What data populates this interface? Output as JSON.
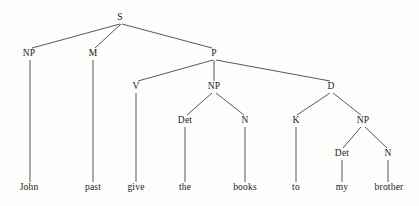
{
  "figure": {
    "kind": "syntax-tree",
    "sentence": "John past give the books to my brother",
    "width": 419,
    "height": 206,
    "background_color": "#fdfdfc",
    "line_color": "#3a3a38",
    "text_color": "#1b1b1b"
  },
  "nodes": [
    {
      "id": "s",
      "label": "S",
      "x": 120,
      "y": 18
    },
    {
      "id": "np1",
      "label": "NP",
      "x": 29,
      "y": 54
    },
    {
      "id": "m",
      "label": "M",
      "x": 93,
      "y": 54
    },
    {
      "id": "p",
      "label": "P",
      "x": 214,
      "y": 54
    },
    {
      "id": "v",
      "label": "V",
      "x": 136,
      "y": 87
    },
    {
      "id": "np2",
      "label": "NP",
      "x": 214,
      "y": 87
    },
    {
      "id": "d",
      "label": "D",
      "x": 331,
      "y": 87
    },
    {
      "id": "det1",
      "label": "Det",
      "x": 185,
      "y": 121
    },
    {
      "id": "n1",
      "label": "N",
      "x": 245,
      "y": 121
    },
    {
      "id": "k",
      "label": "K",
      "x": 296,
      "y": 121
    },
    {
      "id": "np3",
      "label": "NP",
      "x": 363,
      "y": 121
    },
    {
      "id": "det2",
      "label": "Det",
      "x": 342,
      "y": 154
    },
    {
      "id": "n2",
      "label": "N",
      "x": 388,
      "y": 154
    }
  ],
  "leaves": [
    {
      "id": "leaf-john",
      "label": "John",
      "x": 29,
      "y": 188
    },
    {
      "id": "leaf-past",
      "label": "past",
      "x": 93,
      "y": 188
    },
    {
      "id": "leaf-give",
      "label": "give",
      "x": 136,
      "y": 188
    },
    {
      "id": "leaf-the",
      "label": "the",
      "x": 185,
      "y": 188
    },
    {
      "id": "leaf-books",
      "label": "books",
      "x": 245,
      "y": 188
    },
    {
      "id": "leaf-to",
      "label": "to",
      "x": 296,
      "y": 188
    },
    {
      "id": "leaf-my",
      "label": "my",
      "x": 342,
      "y": 188
    },
    {
      "id": "leaf-brother",
      "label": "brother",
      "x": 389,
      "y": 188
    }
  ],
  "edges": [
    {
      "id": "e-s-np1",
      "x1": 120,
      "y1": 24,
      "x2": 32,
      "y2": 48
    },
    {
      "id": "e-s-m",
      "x1": 121,
      "y1": 24,
      "x2": 95,
      "y2": 48
    },
    {
      "id": "e-s-p",
      "x1": 122,
      "y1": 24,
      "x2": 212,
      "y2": 48
    },
    {
      "id": "e-np1-john",
      "x1": 30,
      "y1": 60,
      "x2": 30,
      "y2": 182
    },
    {
      "id": "e-m-past",
      "x1": 93,
      "y1": 60,
      "x2": 93,
      "y2": 182
    },
    {
      "id": "e-p-v",
      "x1": 213,
      "y1": 60,
      "x2": 138,
      "y2": 81
    },
    {
      "id": "e-p-np2",
      "x1": 214,
      "y1": 60,
      "x2": 214,
      "y2": 81
    },
    {
      "id": "e-p-d",
      "x1": 216,
      "y1": 60,
      "x2": 330,
      "y2": 81
    },
    {
      "id": "e-v-give",
      "x1": 136,
      "y1": 93,
      "x2": 136,
      "y2": 182
    },
    {
      "id": "e-np2-det1",
      "x1": 212,
      "y1": 93,
      "x2": 187,
      "y2": 115
    },
    {
      "id": "e-np2-n1",
      "x1": 216,
      "y1": 93,
      "x2": 244,
      "y2": 115
    },
    {
      "id": "e-d-k",
      "x1": 330,
      "y1": 93,
      "x2": 297,
      "y2": 115
    },
    {
      "id": "e-d-np3",
      "x1": 333,
      "y1": 93,
      "x2": 361,
      "y2": 115
    },
    {
      "id": "e-det1-the",
      "x1": 185,
      "y1": 127,
      "x2": 185,
      "y2": 182
    },
    {
      "id": "e-n1-books",
      "x1": 245,
      "y1": 127,
      "x2": 245,
      "y2": 182
    },
    {
      "id": "e-k-to",
      "x1": 296,
      "y1": 127,
      "x2": 296,
      "y2": 182
    },
    {
      "id": "e-np3-det2",
      "x1": 361,
      "y1": 127,
      "x2": 343,
      "y2": 148
    },
    {
      "id": "e-np3-n2",
      "x1": 365,
      "y1": 127,
      "x2": 387,
      "y2": 148
    },
    {
      "id": "e-det2-my",
      "x1": 342,
      "y1": 160,
      "x2": 342,
      "y2": 182
    },
    {
      "id": "e-n2-brother",
      "x1": 388,
      "y1": 160,
      "x2": 388,
      "y2": 182
    }
  ]
}
